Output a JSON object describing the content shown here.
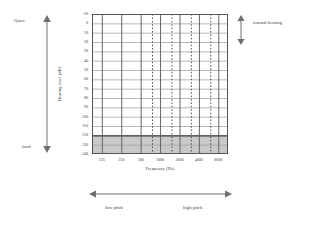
{
  "figure": {
    "kind": "audiogram-blank-chart"
  },
  "annotations": {
    "quiet": "Quiet",
    "loud": "loud",
    "normal_hearing": "normal hearing",
    "low_pitch": "low pitch",
    "high_pitch": "high pitch"
  },
  "icons": {
    "loudness_arrow": "double-arrow-vertical-icon",
    "normal_hearing_arrow": "double-arrow-vertical-icon",
    "pitch_arrow": "double-arrow-horizontal-icon"
  },
  "colors": {
    "axis": "#555555",
    "gridline_major": "#666666",
    "gridline_minor": "#999999",
    "gridline_dotted": "#444444",
    "shaded_band": "#c9c9c9",
    "text": "#3f3f3f",
    "background": "#ffffff"
  },
  "chart_data": {
    "type": "line",
    "title": "",
    "subtitle": "",
    "xlabel": "Frequency (Hz)",
    "ylabel": "Hearing level (dB)",
    "x_scale": "log2-octave",
    "xlim": [
      88,
      11314
    ],
    "ylim": [
      -10,
      140
    ],
    "y_inverted": true,
    "grid": true,
    "legend": null,
    "x_tick_labels": [
      "125",
      "250",
      "500",
      "1000",
      "2000",
      "4000",
      "8000"
    ],
    "x_tick_values": [
      125,
      250,
      500,
      1000,
      2000,
      4000,
      8000
    ],
    "x_minor_dotted_values": [
      750,
      1500,
      3000,
      6000
    ],
    "y_tick_labels": [
      "-10",
      "0",
      "10",
      "20",
      "30",
      "40",
      "50",
      "60",
      "70",
      "80",
      "90",
      "100",
      "110",
      "120",
      "130",
      "140"
    ],
    "y_tick_values": [
      -10,
      0,
      10,
      20,
      30,
      40,
      50,
      60,
      70,
      80,
      90,
      100,
      110,
      120,
      130,
      140
    ],
    "shaded_regions": [
      {
        "axis": "y",
        "from": 120,
        "to": 140,
        "color": "#c9c9c9",
        "label": ""
      }
    ],
    "series": [],
    "values": [],
    "categories": []
  }
}
